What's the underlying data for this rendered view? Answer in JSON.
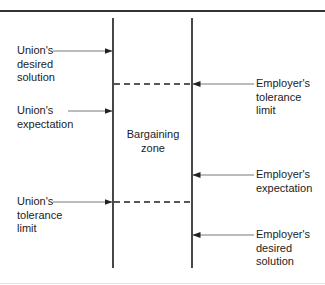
{
  "diagram": {
    "center_label": "Bargaining\nzone",
    "union_labels": [
      {
        "text": "Union's\ndesired\nsolution",
        "arrow_y": 51
      },
      {
        "text": "Union's\nexpectation",
        "arrow_y": 111
      },
      {
        "text": "Union's\ntolerance\nlimit",
        "arrow_y": 202
      }
    ],
    "employer_labels": [
      {
        "text": "Employer's\ntolerance\nlimit",
        "arrow_y": 84
      },
      {
        "text": "Employer's\nexpectation",
        "arrow_y": 175
      },
      {
        "text": "Employer's\ndesired\nsolution",
        "arrow_y": 235
      }
    ],
    "dashed_lines": [
      {
        "name": "employer-tolerance-limit",
        "y": 84
      },
      {
        "name": "union-tolerance-limit",
        "y": 202
      }
    ],
    "colors": {
      "line": "#1a1a1a",
      "arrow": "#555555",
      "text": "#222222"
    }
  }
}
